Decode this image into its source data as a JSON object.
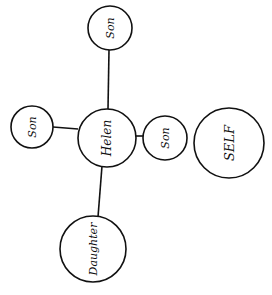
{
  "diagram": {
    "type": "family-relationship-map",
    "nodes": [
      {
        "id": "son_top",
        "label": "Son",
        "cx": 110,
        "cy": 28,
        "r": 22,
        "font_size": 11
      },
      {
        "id": "son_left",
        "label": "Son",
        "cx": 32,
        "cy": 127,
        "r": 21,
        "font_size": 11
      },
      {
        "id": "helen",
        "label": "Helen",
        "cx": 107,
        "cy": 138,
        "r": 29,
        "font_size": 12
      },
      {
        "id": "son_right",
        "label": "Son",
        "cx": 165,
        "cy": 138,
        "r": 22,
        "font_size": 11
      },
      {
        "id": "self",
        "label": "SELF",
        "cx": 229,
        "cy": 143,
        "r": 35,
        "font_size": 13
      },
      {
        "id": "daughter",
        "label": "Daughter",
        "cx": 93,
        "cy": 249,
        "r": 33,
        "font_size": 11
      }
    ],
    "edges": [
      {
        "from": "helen",
        "to": "son_top"
      },
      {
        "from": "helen",
        "to": "son_left"
      },
      {
        "from": "helen",
        "to": "son_right"
      },
      {
        "from": "helen",
        "to": "daughter"
      }
    ]
  }
}
